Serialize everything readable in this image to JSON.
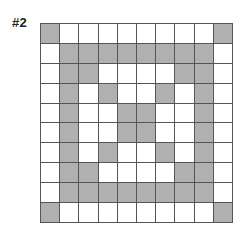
{
  "title": "#2",
  "colors": {
    "filled": "#b0b0b0",
    "empty": "#ffffff",
    "gridline": "#555555"
  },
  "grid": {
    "rows": 10,
    "cols": 10,
    "cells": [
      [
        1,
        0,
        0,
        0,
        0,
        0,
        0,
        0,
        0,
        1
      ],
      [
        0,
        1,
        1,
        1,
        1,
        1,
        1,
        1,
        1,
        0
      ],
      [
        0,
        1,
        1,
        0,
        0,
        0,
        0,
        1,
        1,
        0
      ],
      [
        0,
        1,
        0,
        1,
        0,
        0,
        1,
        0,
        1,
        0
      ],
      [
        0,
        1,
        0,
        0,
        1,
        1,
        0,
        0,
        1,
        0
      ],
      [
        0,
        1,
        0,
        0,
        1,
        1,
        0,
        0,
        1,
        0
      ],
      [
        0,
        1,
        0,
        1,
        0,
        0,
        1,
        0,
        1,
        0
      ],
      [
        0,
        1,
        1,
        0,
        0,
        0,
        0,
        1,
        1,
        0
      ],
      [
        0,
        1,
        1,
        1,
        1,
        1,
        1,
        1,
        1,
        0
      ],
      [
        1,
        0,
        0,
        0,
        0,
        0,
        0,
        0,
        0,
        1
      ]
    ]
  }
}
